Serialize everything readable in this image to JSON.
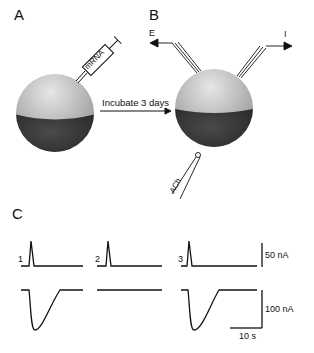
{
  "panels": {
    "a": {
      "label": "A",
      "syringe_text": "mRNA"
    },
    "b": {
      "label": "B",
      "electrode_e": "E",
      "electrode_i": "I",
      "pipette_text": "ACh"
    },
    "c": {
      "label": "C"
    }
  },
  "arrow": {
    "text": "Incubate 3 days"
  },
  "traces": {
    "trial_labels": [
      "1",
      "2",
      "3"
    ],
    "scale_top": "50 nA",
    "scale_bottom": "100 nA",
    "scale_time": "10 s"
  },
  "colors": {
    "sphere_top": "#b8b8b8",
    "sphere_bottom": "#3a3a3a",
    "line": "#111111"
  }
}
